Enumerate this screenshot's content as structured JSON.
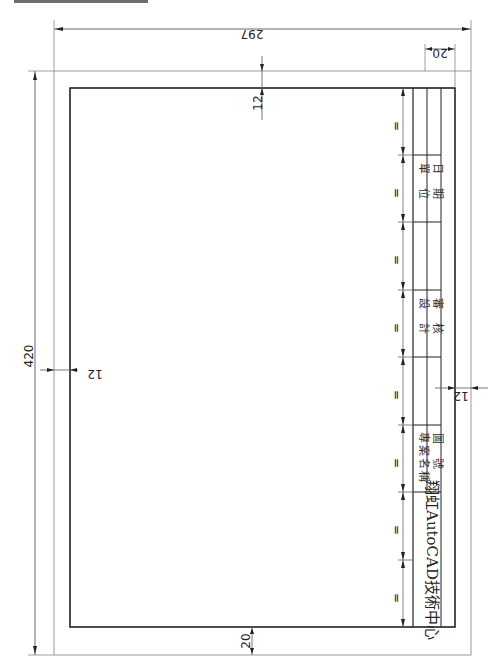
{
  "drawing": {
    "description": "Rotated A3 drawing sheet template with title block and dimensions",
    "colors": {
      "line": "#222222",
      "thin_line": "#8a8a8a",
      "background": "#ffffff"
    },
    "dimensions": {
      "sheet_width": "297",
      "sheet_height": "420",
      "title_block_width": "20",
      "top_margin": "12",
      "left_margin": "12",
      "title_block_margin": "12",
      "bottom_margin": "20",
      "equal_mark": "="
    },
    "title_block": {
      "logo": "翔虹AutoCAD技術中心",
      "project_name_label": "專案名稱",
      "drawing_no_label": "圖號",
      "design_label": "設計",
      "review_label": "審核",
      "unit_label": "單位",
      "date_label": "日期"
    },
    "equal_divisions": 8
  }
}
